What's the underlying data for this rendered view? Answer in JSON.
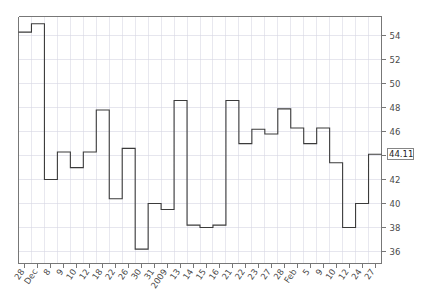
{
  "chart_data": {
    "type": "line",
    "title": "",
    "subtitle": "",
    "xlabel": "",
    "ylabel": "",
    "grid": true,
    "legend": null,
    "line_style": "step",
    "ylim": [
      35.0,
      55.6
    ],
    "y_ticks": [
      36,
      38,
      40,
      42,
      44,
      46,
      48,
      50,
      52,
      54
    ],
    "y_tick_labels": [
      "36",
      "38",
      "40",
      "42",
      "44",
      "46",
      "48",
      "50",
      "52",
      "54"
    ],
    "y_axis_position": "right",
    "last_value_label": "44.11",
    "x_tick_labels": [
      "28",
      "Dec",
      "8",
      "9",
      "10",
      "12",
      "18",
      "22",
      "26",
      "30",
      "31",
      "2009",
      "13",
      "14",
      "15",
      "16",
      "21",
      "22",
      "23",
      "27",
      "28",
      "Feb",
      "5",
      "9",
      "10",
      "12",
      "24",
      "27"
    ],
    "categories": [
      "28",
      "Dec",
      "8",
      "9",
      "10",
      "12",
      "18",
      "22",
      "26",
      "30",
      "31",
      "2009",
      "13",
      "14",
      "15",
      "16",
      "21",
      "22",
      "23",
      "27",
      "28",
      "Feb",
      "5",
      "9",
      "10",
      "12",
      "24",
      "27"
    ],
    "values": [
      54.3,
      55.0,
      42.0,
      44.3,
      43.0,
      44.3,
      47.8,
      40.4,
      44.6,
      36.2,
      40.0,
      39.5,
      48.6,
      38.2,
      38.0,
      38.2,
      48.6,
      45.0,
      46.2,
      45.8,
      47.9,
      46.3,
      45.0,
      46.3,
      43.4,
      38.0,
      40.0,
      44.11
    ],
    "series": [
      {
        "name": "price",
        "values": [
          54.3,
          55.0,
          42.0,
          44.3,
          43.0,
          44.3,
          47.8,
          40.4,
          44.6,
          36.2,
          40.0,
          39.5,
          48.6,
          38.2,
          38.0,
          38.2,
          48.6,
          45.0,
          46.2,
          45.8,
          47.9,
          46.3,
          45.0,
          46.3,
          43.4,
          38.0,
          40.0,
          44.11
        ],
        "color": "#3b3b3b"
      }
    ],
    "colors": {
      "line": "#3b3b3b",
      "grid": "#d8d8e4",
      "axis": "#777777",
      "label_text": "#4a4a4a",
      "background": "#ffffff"
    }
  }
}
